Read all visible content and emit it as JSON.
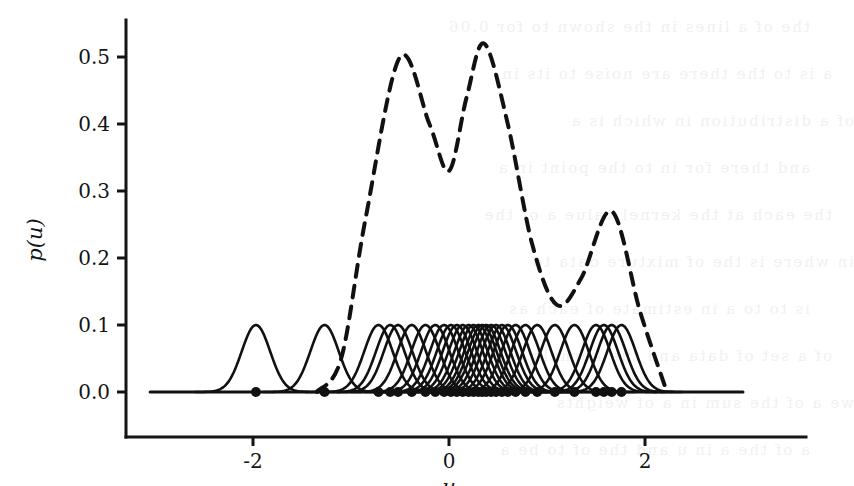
{
  "figure": {
    "width": 812,
    "height": 486,
    "background": "#ffffff",
    "ink_color": "#111111"
  },
  "chart_data": {
    "type": "line",
    "title": "",
    "subtitle": "",
    "xlabel": "u",
    "ylabel": "p(u)",
    "xlim": [
      -3.3,
      3.3
    ],
    "ylim": [
      -0.02,
      0.56
    ],
    "xticks": [
      -2,
      0,
      2
    ],
    "xtick_labels": [
      "-2",
      "0",
      "2"
    ],
    "yticks": [
      0.0,
      0.1,
      0.2,
      0.3,
      0.4,
      0.5
    ],
    "ytick_labels": [
      "0.0",
      "0.1",
      "0.2",
      "0.3",
      "0.4",
      "0.5"
    ],
    "grid": false,
    "legend": null,
    "legend_position": "none",
    "annotations": [],
    "series": [
      {
        "name": "mixture density",
        "style": "dashed",
        "linewidth": 4,
        "color": "#111111",
        "description": "Kernel density estimate: trimodal dashed curve with peaks near u=-0.5 (p=0.50), u=0.36 (p=0.52) and u=1.66 (p=0.27); local minimum near u=0.0 (p=0.33) and near u=1.1 (p=0.13).",
        "keypoints_x": [
          -1.35,
          -1.1,
          -0.85,
          -0.5,
          -0.2,
          0.0,
          0.18,
          0.36,
          0.6,
          0.85,
          1.1,
          1.35,
          1.66,
          1.95,
          2.2
        ],
        "keypoints_y": [
          0.0,
          0.05,
          0.26,
          0.5,
          0.4,
          0.33,
          0.44,
          0.52,
          0.4,
          0.22,
          0.13,
          0.17,
          0.27,
          0.12,
          0.01
        ]
      },
      {
        "name": "kernel components",
        "style": "solid",
        "linewidth": 2.6,
        "color": "#111111",
        "description": "Individual scaled Gaussian kernels, each with peak height 0.10 and standard deviation 0.145, centred on every observed sample.",
        "component_peak_height": 0.1,
        "component_sigma": 0.145
      }
    ],
    "samples": {
      "name": "observed data points",
      "marker": "filled-circle",
      "marker_size": 7,
      "y": 0.0,
      "count": 30,
      "x": [
        -1.97,
        -1.27,
        -0.72,
        -0.6,
        -0.52,
        -0.38,
        -0.24,
        -0.14,
        -0.05,
        0.02,
        0.08,
        0.14,
        0.2,
        0.25,
        0.3,
        0.34,
        0.38,
        0.43,
        0.48,
        0.54,
        0.6,
        0.68,
        0.78,
        0.9,
        1.08,
        1.28,
        1.5,
        1.58,
        1.66,
        1.76
      ]
    }
  },
  "page_bleed": {
    "note": "faint mirrored show-through text from the opposite side of the printed page",
    "lines": [
      "the of a lines in the shown to for 0.06",
      "a is to the there are noise to its in",
      "of a distribution in which is a",
      "and there for in to the point in a",
      "the each at the kernel value a of the",
      "in where is the of mixture data to",
      "is to to a in estimate of each as",
      "of a set of data and the kernels to the",
      "we a of the sum in a of weights",
      "a of the a in u and the of to be a"
    ]
  }
}
